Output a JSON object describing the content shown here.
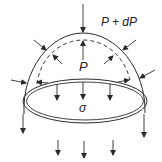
{
  "diagram": {
    "type": "pressure-vessel-dome-free-body",
    "labels": {
      "outer_pressure": "P + dP",
      "inner_pressure": "P",
      "stress": "σ"
    },
    "colors": {
      "stroke": "#2a2a2a",
      "background": "#ffffff"
    },
    "elements": {
      "outer_dome": "solid hemispherical shell outline",
      "inner_dome": "dashed inner surface",
      "ring": "elliptical cut ring (double line)",
      "inward_arrows_outer": 5,
      "outward_arrows_inner": 5,
      "downward_stress_arrows": 8
    }
  }
}
